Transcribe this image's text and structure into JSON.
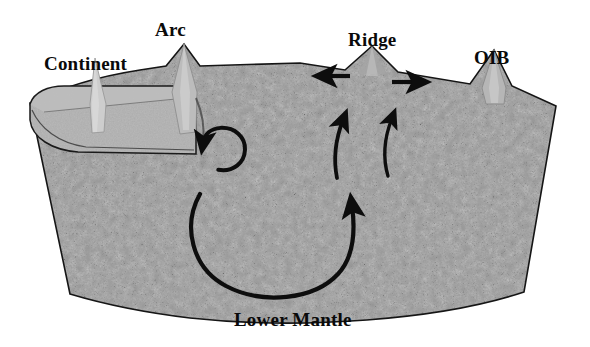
{
  "figure": {
    "kind": "geologic-cross-section",
    "caption_text": "Lower Mantle",
    "background_color": "#ffffff"
  },
  "labels": {
    "continent": "Continent",
    "arc": "Arc",
    "ridge": "Ridge",
    "oib": "OIB",
    "lower_mantle": "Lower Mantle"
  },
  "colors": {
    "mantle_base": "#8e8e8e",
    "mantle_speckle_dark": "#2b2b2b",
    "mantle_speckle_mid": "#5a5a5a",
    "mantle_speckle_light": "#c2c2c2",
    "continent_slab": "#a8a8a8",
    "continent_top_face": "#b8b8b8",
    "volcano_light": "#c8c8c8",
    "outline": "#151515",
    "arrow": "#0d0d0d",
    "label_text": "#0a0a0a"
  },
  "features": {
    "continent": {
      "name": "Continent",
      "description": "light-gray lithospheric slab at upper left riding on the mantle",
      "peak_x": 95
    },
    "arc": {
      "name": "Arc",
      "description": "sharp volcanic peak with a subducting slab descending beneath it",
      "peak_x": 184
    },
    "ridge": {
      "name": "Ridge",
      "description": "mid-ocean ridge bulge with spreading arrows to left and right",
      "peak_x": 372
    },
    "oib": {
      "name": "OIB",
      "description": "ocean island basalt volcano on the right flank",
      "peak_x": 494
    },
    "lower_mantle": {
      "name": "Lower Mantle",
      "description": "speckled wedge body filling the cross-section"
    }
  },
  "arrows": [
    {
      "name": "ridge-spreading-left",
      "direction": "left",
      "type": "straight"
    },
    {
      "name": "ridge-spreading-right",
      "direction": "right",
      "type": "straight"
    },
    {
      "name": "arc-corner-flow",
      "direction": "up",
      "type": "loop"
    },
    {
      "name": "ridge-upwelling-inner",
      "direction": "up",
      "type": "curved"
    },
    {
      "name": "ridge-upwelling-outer",
      "direction": "up",
      "type": "curved"
    },
    {
      "name": "whole-mantle-convection-cell",
      "direction": "up",
      "type": "large-u-curve"
    }
  ]
}
